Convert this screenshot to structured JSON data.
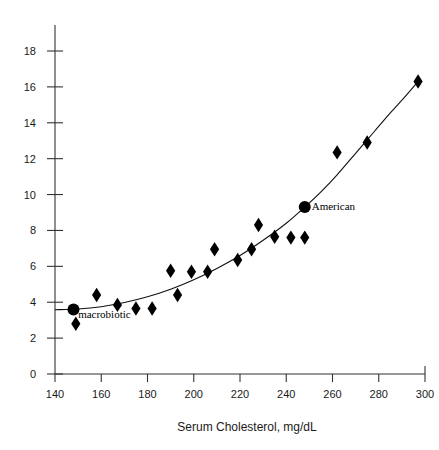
{
  "chart_data": {
    "type": "scatter",
    "title": "",
    "xlabel": "Serum Cholesterol, mg/dL",
    "ylabel": "",
    "xlim": [
      140,
      300
    ],
    "ylim": [
      0,
      18
    ],
    "xticks": [
      140,
      160,
      180,
      200,
      220,
      240,
      260,
      280,
      300
    ],
    "yticks": [
      0,
      2,
      4,
      6,
      8,
      10,
      12,
      14,
      16,
      18
    ],
    "grid": false,
    "legend": "none",
    "series": [
      {
        "name": "data-points",
        "marker": "diamond",
        "color": "#000000",
        "points": [
          {
            "x": 149,
            "y": 2.8
          },
          {
            "x": 158,
            "y": 4.4
          },
          {
            "x": 167,
            "y": 3.85
          },
          {
            "x": 175,
            "y": 3.65
          },
          {
            "x": 182,
            "y": 3.65
          },
          {
            "x": 190,
            "y": 5.75
          },
          {
            "x": 193,
            "y": 4.4
          },
          {
            "x": 199,
            "y": 5.7
          },
          {
            "x": 206,
            "y": 5.7
          },
          {
            "x": 209,
            "y": 6.95
          },
          {
            "x": 219,
            "y": 6.35
          },
          {
            "x": 225,
            "y": 6.95
          },
          {
            "x": 228,
            "y": 8.3
          },
          {
            "x": 235,
            "y": 7.65
          },
          {
            "x": 242,
            "y": 7.6
          },
          {
            "x": 248,
            "y": 7.6
          },
          {
            "x": 262,
            "y": 12.35
          },
          {
            "x": 275,
            "y": 12.9
          },
          {
            "x": 297,
            "y": 16.3
          }
        ]
      },
      {
        "name": "highlighted-populations",
        "marker": "circle",
        "color": "#000000",
        "points": [
          {
            "x": 148,
            "y": 3.6,
            "label": "macrobiotic"
          },
          {
            "x": 248,
            "y": 9.3,
            "label": "American"
          }
        ]
      },
      {
        "name": "fitted-curve",
        "marker": "line",
        "color": "#111111",
        "points": [
          {
            "x": 140,
            "y": 3.58
          },
          {
            "x": 150,
            "y": 3.62
          },
          {
            "x": 160,
            "y": 3.75
          },
          {
            "x": 170,
            "y": 3.98
          },
          {
            "x": 180,
            "y": 4.3
          },
          {
            "x": 190,
            "y": 4.72
          },
          {
            "x": 200,
            "y": 5.25
          },
          {
            "x": 210,
            "y": 5.88
          },
          {
            "x": 220,
            "y": 6.6
          },
          {
            "x": 230,
            "y": 7.45
          },
          {
            "x": 240,
            "y": 8.4
          },
          {
            "x": 248,
            "y": 9.3
          },
          {
            "x": 255,
            "y": 10.15
          },
          {
            "x": 262,
            "y": 11.1
          },
          {
            "x": 270,
            "y": 12.3
          },
          {
            "x": 278,
            "y": 13.5
          },
          {
            "x": 285,
            "y": 14.55
          },
          {
            "x": 291,
            "y": 15.4
          },
          {
            "x": 297,
            "y": 16.3
          }
        ]
      }
    ],
    "annotations": [
      {
        "text": "macrobiotic",
        "x": 150,
        "y": 3.35
      },
      {
        "text": "American",
        "x": 251,
        "y": 9.35
      }
    ]
  },
  "axes": {
    "x_tick_labels": [
      "140",
      "160",
      "180",
      "200",
      "220",
      "240",
      "260",
      "280",
      "300"
    ],
    "y_tick_labels": [
      "0",
      "2",
      "4",
      "6",
      "8",
      "10",
      "12",
      "14",
      "16",
      "18"
    ],
    "x_axis_title": "Serum Cholesterol, mg/dL"
  }
}
